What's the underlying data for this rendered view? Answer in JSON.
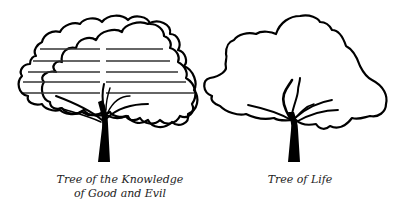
{
  "figure": {
    "trees": [
      {
        "id": "knowledge",
        "caption_lines": [
          "Tree of the Knowledge",
          "of Good and Evil"
        ],
        "has_horizontal_lines": true,
        "horizontal_line_count": 5
      },
      {
        "id": "life",
        "caption_lines": [
          "Tree of Life"
        ],
        "has_horizontal_lines": false
      }
    ],
    "colors": {
      "stroke": "#000000",
      "hlines": "#333333",
      "caption": "#222222",
      "background": "#ffffff"
    }
  }
}
